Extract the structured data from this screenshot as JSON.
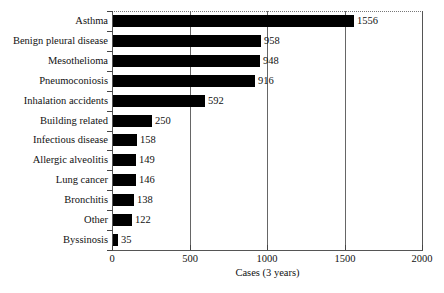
{
  "chart_data": {
    "type": "bar",
    "orientation": "horizontal",
    "title": "",
    "xlabel": "Cases (3 years)",
    "ylabel": "",
    "xlim": [
      0,
      2000
    ],
    "xticks": [
      0,
      500,
      1000,
      1500,
      2000
    ],
    "xtick_labels": [
      "0",
      "500",
      "1000",
      "1500",
      "2000"
    ],
    "grid": "vertical",
    "legend": "none",
    "bar_color": "#000000",
    "categories": [
      "Asthma",
      "Benign pleural disease",
      "Mesothelioma",
      "Pneumoconiosis",
      "Inhalation accidents",
      "Building related",
      "Infectious disease",
      "Allergic alveolitis",
      "Lung cancer",
      "Bronchitis",
      "Other",
      "Byssinosis"
    ],
    "values": [
      1556,
      958,
      948,
      916,
      592,
      250,
      158,
      149,
      146,
      138,
      122,
      35
    ],
    "value_labels": [
      "1556",
      "958",
      "948",
      "916",
      "592",
      "250",
      "158",
      "149",
      "146",
      "138",
      "122",
      "35"
    ]
  }
}
